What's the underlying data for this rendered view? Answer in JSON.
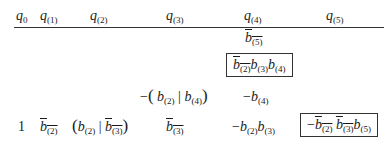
{
  "table": {
    "headers": [
      {
        "var": "q",
        "sub": "0"
      },
      {
        "var": "q",
        "sub": "(1)"
      },
      {
        "var": "q",
        "sub": "(2)"
      },
      {
        "var": "q",
        "sub": "(3)"
      },
      {
        "var": "q",
        "sub": "(4)"
      },
      {
        "var": "q",
        "sub": "(5)"
      }
    ],
    "rows": [
      {
        "q4": {
          "text": "b̅(5)",
          "boxed": false
        }
      },
      {
        "q4": {
          "text": "b̅(2) b(3) b(4)",
          "boxed": true
        }
      },
      {
        "q3": {
          "text": "−(b(2) | b(4))"
        },
        "q4": {
          "text": "−b(4)"
        }
      },
      {
        "q0": "1",
        "q1": "b̅(2)",
        "q2": "(b(2) | b̅(3))",
        "q3": "b̅(3)",
        "q4": "−b(2) b(3)",
        "q5": {
          "text": "−b̅(2) b̅(3) b(5)",
          "boxed": true
        }
      }
    ],
    "labels": {
      "one": "1",
      "minus": "−",
      "b": "b",
      "q": "q",
      "lparen": "(",
      "rparen": ")",
      "bar": "|",
      "s0": "0",
      "s1": "(1)",
      "s2": "(2)",
      "s3": "(3)",
      "s4": "(4)",
      "s5": "(5)"
    }
  }
}
